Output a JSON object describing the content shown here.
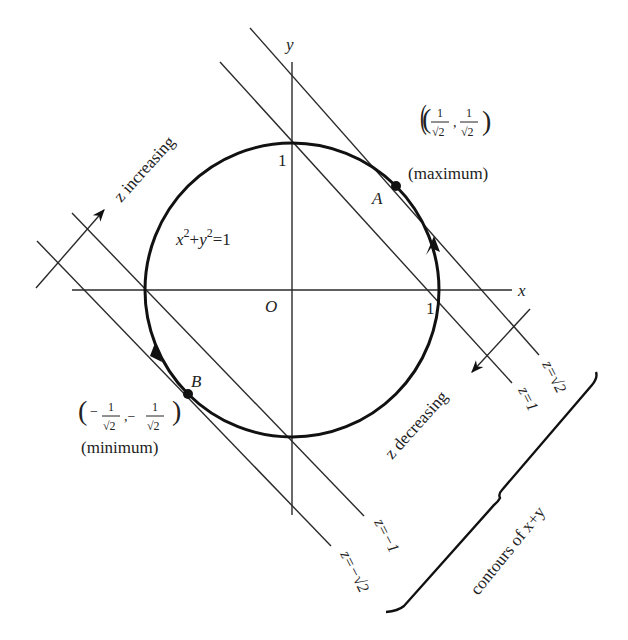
{
  "figure": {
    "axes": {
      "x_label": "x",
      "y_label": "y",
      "origin_label": "O",
      "x_tick": "1",
      "y_tick": "1"
    },
    "circle": {
      "equation": "x²+y²=1",
      "eq_x": "x",
      "eq_y": "y",
      "eq_sup": "2",
      "eq_rest": "=1",
      "eq_plus": "+"
    },
    "points": {
      "A": {
        "label": "A",
        "coords_num": "1",
        "coords_den": "√2",
        "note": "(maximum)",
        "coords_text": "(1/√2, 1/√2)"
      },
      "B": {
        "label": "B",
        "coords_num": "1",
        "coords_den": "√2",
        "note": "(minimum)",
        "coords_text": "(−1/√2, −1/√2)"
      }
    },
    "contours": [
      {
        "label": "z=√2",
        "value": "√2"
      },
      {
        "label": "z=1",
        "value": "1"
      },
      {
        "label": "z=−1",
        "value": "−1"
      },
      {
        "label": "z=−√2",
        "value": "−√2"
      }
    ],
    "arrows": {
      "increasing": "z increasing",
      "decreasing": "z decreasing"
    },
    "brace_label": "contours of x+y"
  }
}
